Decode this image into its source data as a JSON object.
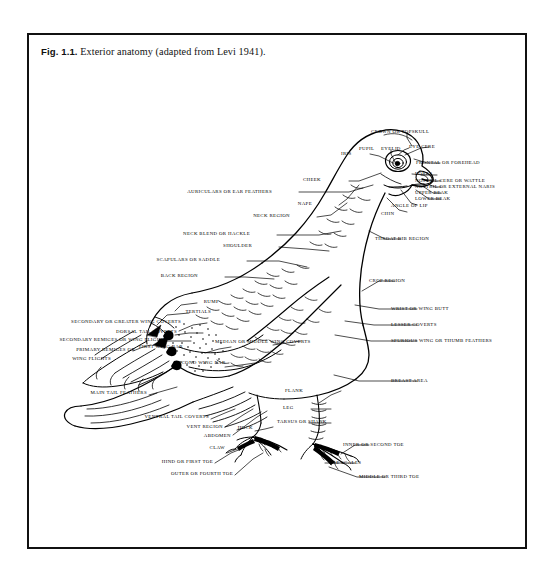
{
  "figure": {
    "number_label": "Fig. 1.1.",
    "caption": "Exterior anatomy (adapted from Levi 1941).",
    "border_color": "#111111",
    "background_color": "#ffffff",
    "ink_color": "#000000"
  },
  "labels": {
    "right": [
      {
        "id": "crown-or-topskull",
        "text": "CROWN OR TOPSKULL"
      },
      {
        "id": "pupil",
        "text": "PUPIL"
      },
      {
        "id": "eyelid",
        "text": "EYELID"
      },
      {
        "id": "eye-cere",
        "text": "EYE CERE"
      },
      {
        "id": "iris",
        "text": "IRIS"
      },
      {
        "id": "frontal-or-forehead",
        "text": "FRONTAL OR FOREHEAD"
      },
      {
        "id": "lores",
        "text": "LORES"
      },
      {
        "id": "nostril-cere-or-wattle",
        "text": "NOSTRIL CERE OR WATTLE"
      },
      {
        "id": "nostril-or-external-naris",
        "text": "NOSTRIL OR EXTERNAL NARIS"
      },
      {
        "id": "upper-beak",
        "text": "UPPER BEAK"
      },
      {
        "id": "lower-beak",
        "text": "LOWER BEAK"
      },
      {
        "id": "angle-of-lip",
        "text": "ANGLE OF LIP"
      },
      {
        "id": "chin",
        "text": "CHIN"
      },
      {
        "id": "throat-bib-region",
        "text": "THROAT BIB REGION"
      },
      {
        "id": "crop-region",
        "text": "CROP REGION"
      },
      {
        "id": "wrist-or-wing-butt",
        "text": "WRIST OR WING BUTT"
      },
      {
        "id": "lesser-coverts",
        "text": "LESSER COVERTS"
      },
      {
        "id": "spurious-wing-or-thumb-feathers",
        "text": "SPURIOUS WING OR THUMB FEATHERS"
      },
      {
        "id": "breast-area",
        "text": "BREAST AREA"
      },
      {
        "id": "inner-or-second-toe",
        "text": "INNER OR SECOND TOE"
      },
      {
        "id": "toe-scales",
        "text": "TOE SCALES"
      },
      {
        "id": "middle-or-third-toe",
        "text": "MIDDLE OR THIRD TOE"
      }
    ],
    "left": [
      {
        "id": "cheek",
        "text": "CHEEK"
      },
      {
        "id": "auriculars-or-ear-feathers",
        "text": "AURICULARS OR EAR FEATHERS"
      },
      {
        "id": "nape",
        "text": "NAPE"
      },
      {
        "id": "neck-region",
        "text": "NECK REGION"
      },
      {
        "id": "neck-blend-or-hackle",
        "text": "NECK BLEND OR HACKLE"
      },
      {
        "id": "shoulder",
        "text": "SHOULDER"
      },
      {
        "id": "scapulars-or-saddle",
        "text": "SCAPULARS OR SADDLE"
      },
      {
        "id": "back-region",
        "text": "BACK REGION"
      },
      {
        "id": "tertials",
        "text": "TERTIALS"
      },
      {
        "id": "rump",
        "text": "RUMP"
      },
      {
        "id": "secondary-or-greater-wing-coverts",
        "text": "SECONDARY OR GREATER WING COVERTS"
      },
      {
        "id": "dorsal-tail-coverts",
        "text": "DORSAL TAIL COVERTS"
      },
      {
        "id": "secondary-remiges-or-wing-flights",
        "text": "SECONDARY REMIGES OR WING FLIGHTS"
      },
      {
        "id": "primary-remiges-or",
        "text": "PRIMARY REMIGES OR"
      },
      {
        "id": "wing-flights",
        "text": "WING FLIGHTS"
      },
      {
        "id": "first-wing-bar",
        "text": "FIRST WING BAR"
      },
      {
        "id": "median-or-middle-wing-coverts",
        "text": "MEDIAN OR MIDDLE WING COVERTS"
      },
      {
        "id": "second-wing-bar",
        "text": "SECOND WING BAR"
      },
      {
        "id": "main-tail-feathers",
        "text": "MAIN TAIL FEATHERS"
      },
      {
        "id": "ventral-tail-coverts",
        "text": "VENTRAL TAIL COVERTS"
      },
      {
        "id": "vent-region",
        "text": "VENT REGION"
      },
      {
        "id": "abdomen",
        "text": "ABDOMEN"
      },
      {
        "id": "flank",
        "text": "FLANK"
      },
      {
        "id": "leg",
        "text": "LEG"
      },
      {
        "id": "tarsus-or-shank",
        "text": "TARSUS OR SHANK"
      },
      {
        "id": "hock",
        "text": "HOCK"
      },
      {
        "id": "claw",
        "text": "CLAW"
      },
      {
        "id": "hind-or-first-toe",
        "text": "HIND OR FIRST TOE"
      },
      {
        "id": "outer-or-fourth-toe",
        "text": "OUTER OR FOURTH TOE"
      }
    ]
  }
}
